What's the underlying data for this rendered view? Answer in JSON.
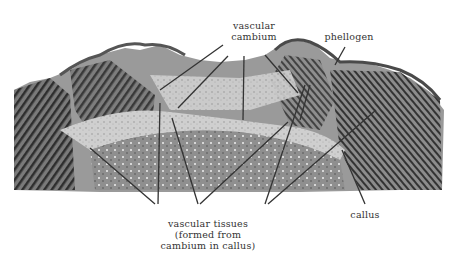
{
  "figure": {
    "labels": {
      "vascular_cambium_line1": "vascular",
      "vascular_cambium_line2": "cambium",
      "phellogen": "phellogen",
      "callus": "callus",
      "vascular_tissues_line1": "vascular tissues",
      "vascular_tissues_line2": "(formed from",
      "vascular_tissues_line3": "cambium in callus)"
    },
    "colors": {
      "background": "#ffffff",
      "tissue_dark": "#3a3a3a",
      "tissue_mid": "#8a8a8a",
      "tissue_light": "#d6d6d6",
      "leader_line": "#333333"
    }
  }
}
